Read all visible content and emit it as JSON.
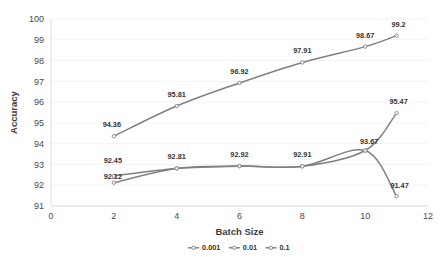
{
  "chart_data": {
    "type": "line",
    "title": "",
    "xlabel": "Batch Size",
    "ylabel": "Accuracy",
    "xlim": [
      0,
      12
    ],
    "ylim": [
      91,
      100
    ],
    "xticks": [
      "0",
      "2",
      "4",
      "6",
      "8",
      "10",
      "12"
    ],
    "yticks": [
      "91",
      "92",
      "93",
      "94",
      "95",
      "96",
      "97",
      "98",
      "99",
      "100"
    ],
    "grid": true,
    "legend_position": "bottom",
    "smoothing": "spline",
    "line_color": "#808080",
    "marker_color": "#808080",
    "series": [
      {
        "name": "0.001",
        "x": [
          2,
          4,
          6,
          8,
          10,
          11
        ],
        "values": [
          94.36,
          95.81,
          96.92,
          97.91,
          98.67,
          99.2
        ],
        "labels": [
          "94.36",
          "95.81",
          "96.92",
          "97.91",
          "98.67",
          "99.2"
        ]
      },
      {
        "name": "0.01",
        "x": [
          2,
          4,
          6,
          8,
          10,
          11
        ],
        "values": [
          92.45,
          92.81,
          92.92,
          92.91,
          93.67,
          91.47
        ],
        "labels": [
          "92.45",
          "",
          "",
          "",
          "93.67",
          "91.47"
        ]
      },
      {
        "name": "0.1",
        "x": [
          2,
          4,
          6,
          8,
          10,
          11
        ],
        "values": [
          92.12,
          92.81,
          92.92,
          92.91,
          93.67,
          95.47
        ],
        "labels": [
          "92.12",
          "92.81",
          "92.92",
          "92.91",
          "",
          "95.47"
        ]
      }
    ],
    "legend": [
      "0.001",
      "0.01",
      "0.1"
    ]
  },
  "axes": {
    "y_title": "Accuracy",
    "x_title": "Batch Size"
  }
}
